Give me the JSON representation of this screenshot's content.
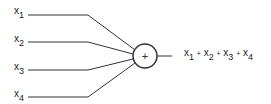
{
  "diagram": {
    "type": "summation-node",
    "inputs": [
      {
        "var": "x",
        "sub": "1",
        "y": 15
      },
      {
        "var": "x",
        "sub": "2",
        "y": 42
      },
      {
        "var": "x",
        "sub": "3",
        "y": 70
      },
      {
        "var": "x",
        "sub": "4",
        "y": 97
      }
    ],
    "node": {
      "symbol": "+",
      "cx": 145,
      "cy": 56,
      "r": 12
    },
    "output": {
      "terms": [
        {
          "var": "x",
          "sub": "1"
        },
        {
          "var": "x",
          "sub": "2"
        },
        {
          "var": "x",
          "sub": "3"
        },
        {
          "var": "x",
          "sub": "4"
        }
      ],
      "operator": "+"
    },
    "stroke_color": "#333333"
  }
}
